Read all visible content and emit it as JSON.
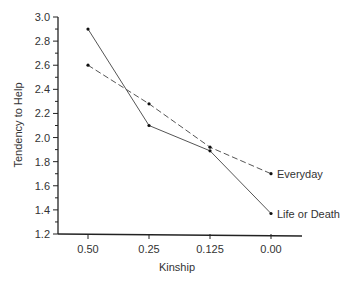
{
  "chart_data": {
    "type": "line",
    "title": "",
    "xlabel": "Kinship",
    "ylabel": "Tendency to Help",
    "categories": [
      "0.50",
      "0.25",
      "0.125",
      "0.00"
    ],
    "series": [
      {
        "name": "Everyday",
        "values": [
          2.6,
          2.28,
          1.92,
          1.7
        ],
        "style": "dashed"
      },
      {
        "name": "Life or Death",
        "values": [
          2.9,
          2.1,
          1.89,
          1.37
        ],
        "style": "solid"
      }
    ],
    "ylim": [
      1.2,
      3.0
    ],
    "yticks": [
      "1.2",
      "1.4",
      "1.6",
      "1.8",
      "2.0",
      "2.2",
      "2.4",
      "2.6",
      "2.8",
      "3.0"
    ],
    "grid": false,
    "legend_position": "inline-right"
  }
}
